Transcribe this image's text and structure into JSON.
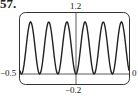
{
  "problem_number": "57.",
  "chart_data": {
    "type": "line",
    "title": "",
    "xlabel": "",
    "ylabel": "",
    "xlim": [
      -0.5,
      0.5
    ],
    "ylim": [
      -0.2,
      1.2
    ],
    "window_labels": {
      "xmin": "−0.5",
      "xmax": "0",
      "ymin": "−0.2",
      "ymax": "1.2"
    },
    "grid": false,
    "series": [
      {
        "name": "f(x)",
        "description": "periodic curve oscillating between 0 and 1, six peaks across the window, minimum 0 at x=0",
        "peaks": 6,
        "min": 0,
        "max": 1,
        "color": "#222222"
      }
    ]
  }
}
